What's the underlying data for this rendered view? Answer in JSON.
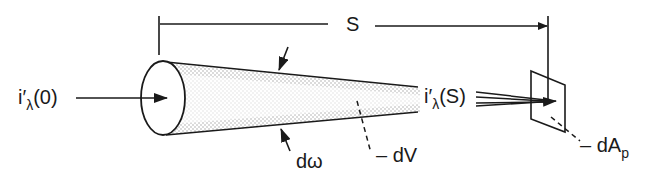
{
  "diagram": {
    "type": "radiation-path-schematic",
    "colors": {
      "ink": "#1a1a1a",
      "stipple": "#9a9a9a",
      "background": "#ffffff"
    },
    "labels": {
      "path_length": "S",
      "intensity_in_prefix": "i′",
      "intensity_in_sub": "λ",
      "intensity_in_arg": "(0)",
      "intensity_out_prefix": "i′",
      "intensity_out_sub": "λ",
      "intensity_out_arg": "(S)",
      "solid_angle": "dω",
      "volume_element": "– dV",
      "area_prefix": "– dA",
      "area_sub": "p"
    },
    "elements": [
      {
        "name": "dimension-line",
        "label": "S",
        "from_x": 157,
        "to_x": 547,
        "y": 24
      },
      {
        "name": "cone",
        "base_center": [
          155,
          98
        ],
        "apex_x": 420
      },
      {
        "name": "receiving-area",
        "label": "dAp",
        "shape": "parallelogram"
      }
    ]
  }
}
